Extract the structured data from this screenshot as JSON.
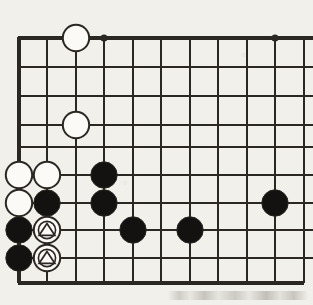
{
  "figure": {
    "kind": "go-board-diagram",
    "background_color": "#f2f0ea",
    "line_color": "#2b2722",
    "black_stone_color": "#141210",
    "white_stone_color": "#fbfaf7",
    "white_stone_border_color": "#2b2722"
  },
  "board": {
    "columns_x": [
      19,
      47,
      76,
      104,
      133,
      161,
      190,
      218,
      247,
      275,
      304
    ],
    "rows_y": [
      38,
      67,
      96,
      125,
      147,
      175,
      203,
      230,
      258,
      283
    ],
    "edge_left_x": 19,
    "edge_top_y": 38,
    "edge_bottom_y": 283,
    "edge_right_x": 304,
    "line_width": 2,
    "edge_line_width": 4,
    "cell_size": 28.5
  },
  "star_points": [
    {
      "name": "star-point-top-left",
      "x": 104,
      "y": 38,
      "radius": 3.6
    },
    {
      "name": "star-point-top-right",
      "x": 275,
      "y": 38,
      "radius": 3.6
    }
  ],
  "stones": [
    {
      "id": "w1",
      "color": "white",
      "x": 76,
      "y": 38,
      "marker": "none"
    },
    {
      "id": "w2",
      "color": "white",
      "x": 76,
      "y": 125,
      "marker": "none"
    },
    {
      "id": "w3",
      "color": "white",
      "x": 19,
      "y": 175,
      "marker": "none"
    },
    {
      "id": "w4",
      "color": "white",
      "x": 47,
      "y": 175,
      "marker": "none"
    },
    {
      "id": "w5",
      "color": "white",
      "x": 19,
      "y": 203,
      "marker": "none"
    },
    {
      "id": "wt1",
      "color": "white",
      "x": 47,
      "y": 230,
      "marker": "triangle"
    },
    {
      "id": "wt2",
      "color": "white",
      "x": 47,
      "y": 258,
      "marker": "triangle"
    },
    {
      "id": "b1",
      "color": "black",
      "x": 104,
      "y": 175,
      "marker": "none"
    },
    {
      "id": "b2",
      "color": "black",
      "x": 47,
      "y": 203,
      "marker": "none"
    },
    {
      "id": "b3",
      "color": "black",
      "x": 104,
      "y": 203,
      "marker": "none"
    },
    {
      "id": "b4",
      "color": "black",
      "x": 275,
      "y": 203,
      "marker": "none"
    },
    {
      "id": "b5",
      "color": "black",
      "x": 19,
      "y": 230,
      "marker": "none"
    },
    {
      "id": "b6",
      "color": "black",
      "x": 133,
      "y": 230,
      "marker": "none"
    },
    {
      "id": "b7",
      "color": "black",
      "x": 190,
      "y": 230,
      "marker": "none"
    },
    {
      "id": "b8",
      "color": "black",
      "x": 19,
      "y": 258,
      "marker": "none"
    }
  ],
  "stone_radius": 13.2,
  "marker_radius": 8.6,
  "counts": {
    "black_stones": 8,
    "white_stones": 7,
    "marked_stones": 2,
    "star_points": 2
  }
}
